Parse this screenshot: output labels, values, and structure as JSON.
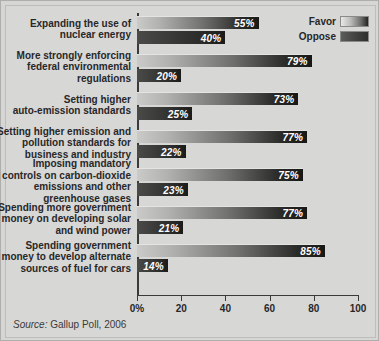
{
  "chart_data": {
    "type": "bar",
    "orientation": "horizontal",
    "title": "",
    "xlabel": "",
    "ylabel": "",
    "xlim": [
      0,
      100
    ],
    "grid": false,
    "legend_position": "top-right",
    "categories": [
      "Expanding the use of\nnuclear energy",
      "More strongly enforcing\nfederal environmental\nregulations",
      "Setting higher\nauto-emission standards",
      "Setting higher emission and\npollution standards for\nbusiness and industry",
      "Imposing mandatory\ncontrols on carbon-dioxide\nemissions and other\ngreenhouse gases",
      "Spending more government\nmoney on developing solar\nand wind power",
      "Spending government\nmoney to develop alternate\nsources of fuel for cars"
    ],
    "series": [
      {
        "name": "Favor",
        "values": [
          55,
          79,
          73,
          77,
          75,
          77,
          85
        ],
        "labels": [
          "55%",
          "79%",
          "73%",
          "77%",
          "75%",
          "77%",
          "85%"
        ]
      },
      {
        "name": "Oppose",
        "values": [
          40,
          20,
          25,
          22,
          23,
          21,
          14
        ],
        "labels": [
          "40%",
          "20%",
          "25%",
          "22%",
          "23%",
          "21%",
          "14%"
        ]
      }
    ],
    "xticks": [
      0,
      20,
      40,
      60,
      80,
      100
    ],
    "xtick_labels": [
      "0%",
      "20",
      "40",
      "60",
      "80",
      "100"
    ]
  },
  "legend": {
    "items": [
      {
        "label": "Favor",
        "swatch": "favor-gradient-swatch"
      },
      {
        "label": "Oppose",
        "swatch": "oppose-gradient-swatch"
      }
    ]
  },
  "source": {
    "prefix": "Source:",
    "text": " Gallup Poll, 2006"
  },
  "colors": {
    "background": "#d6d6d4",
    "favor_bar_light": "#cacac8",
    "favor_bar_dark": "#171715",
    "oppose_bar_light": "#4a4a48",
    "oppose_bar_dark": "#1b1b19",
    "axis": "#3a3a3a",
    "text": "#27272a",
    "value_text": "#ffffff"
  }
}
